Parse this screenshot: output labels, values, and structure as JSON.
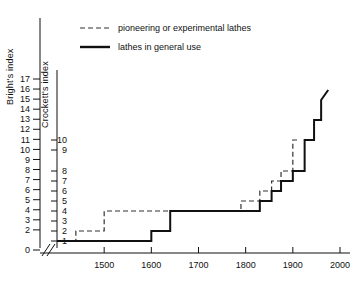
{
  "chart_data": {
    "type": "line",
    "title": "",
    "xlabel": "",
    "ylabel": "Bright's index",
    "ylabel_secondary": "Crockett's index",
    "grid": false,
    "legend_position": "top-center",
    "xlim": [
      1400,
      2000
    ],
    "xticks": [
      1500,
      1600,
      1700,
      1800,
      1900,
      2000
    ],
    "xtick_labels": [
      "1500",
      "1600",
      "1700",
      "1800",
      "1900",
      "2000"
    ],
    "axis_break": "//",
    "ylim_bright": [
      0,
      17
    ],
    "yticks_bright": [
      0,
      2,
      3,
      4,
      5,
      6,
      7,
      8,
      9,
      10,
      11,
      12,
      13,
      14,
      15,
      16,
      17
    ],
    "ytick_labels_bright": [
      "0",
      "2",
      "3",
      "4",
      "5",
      "6",
      "7",
      "8",
      "9",
      "10",
      "11",
      "12",
      "13",
      "14",
      "15",
      "16",
      "17"
    ],
    "yticks_crockett": [
      1,
      2,
      3,
      4,
      5,
      6,
      7,
      8,
      9,
      10
    ],
    "ytick_labels_crockett": [
      "1",
      "2",
      "3",
      "4",
      "5",
      "6",
      "7",
      "8",
      "9",
      "10"
    ],
    "series": [
      {
        "name": "pioneering or experimental lathes",
        "style": "dashed",
        "step": "post",
        "x": [
          1400,
          1440,
          1440,
          1500,
          1500,
          1640,
          1640,
          1790,
          1790,
          1830,
          1830,
          1855,
          1855,
          1875,
          1875,
          1900,
          1900,
          1915
        ],
        "values": [
          1,
          1,
          2,
          2,
          4,
          4,
          4,
          4,
          5,
          5,
          6,
          6,
          7,
          7,
          8,
          8,
          10,
          10
        ]
      },
      {
        "name": "lathes in general use",
        "style": "solid",
        "step": "post",
        "x": [
          1400,
          1600,
          1600,
          1640,
          1640,
          1800,
          1800,
          1830,
          1830,
          1855,
          1855,
          1875,
          1875,
          1900,
          1900,
          1925,
          1925,
          1945,
          1945,
          1960,
          1960,
          1975
        ],
        "values": [
          1,
          1,
          2,
          2,
          4,
          4,
          4,
          4,
          5,
          5,
          6,
          6,
          7,
          7,
          8,
          8,
          10,
          10,
          12,
          12,
          14,
          15
        ]
      }
    ]
  },
  "legend": {
    "items": [
      {
        "label": "pioneering or experimental lathes",
        "style": "dashed"
      },
      {
        "label": "lathes in general use",
        "style": "solid"
      }
    ]
  },
  "axes": {
    "primary_title": "Bright's index",
    "secondary_title": "Crockett's index"
  }
}
